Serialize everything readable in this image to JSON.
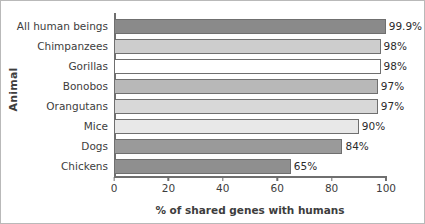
{
  "chart_data": {
    "type": "bar",
    "orientation": "horizontal",
    "title": "",
    "xlabel": "% of shared genes with humans",
    "ylabel": "Animal",
    "categories": [
      "All human beings",
      "Chimpanzees",
      "Gorillas",
      "Bonobos",
      "Orangutans",
      "Mice",
      "Dogs",
      "Chickens"
    ],
    "values": [
      99.9,
      98,
      98,
      97,
      97,
      90,
      84,
      65
    ],
    "value_labels": [
      "99.9%",
      "98%",
      "98%",
      "97%",
      "97%",
      "90%",
      "84%",
      "65%"
    ],
    "bar_colors": [
      "#8a8a8a",
      "#cdcdcd",
      "#ffffff",
      "#b8b8b8",
      "#d8d8d8",
      "#e8e8e8",
      "#9a9a9a",
      "#8f8f8f"
    ],
    "bar_edge_color": "#6f6f6f",
    "xlim": [
      0,
      100
    ],
    "xticks": [
      0,
      20,
      40,
      60,
      80,
      100
    ],
    "xtick_labels": [
      "0",
      "20",
      "40",
      "60",
      "80",
      "100"
    ],
    "grid": false,
    "legend": false
  }
}
